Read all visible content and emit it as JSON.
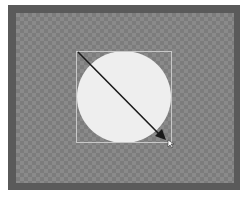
{
  "canvas": {
    "background": "transparent-checkerboard",
    "frame_color": "#5a5a5a",
    "checker_light": "#8a8a8a",
    "checker_dark": "#7c7c7c"
  },
  "shape": {
    "type": "ellipse",
    "fill": "#eeeeee",
    "selected": true
  },
  "selection_box": {
    "stroke": "#c8c8c8"
  },
  "drag_arrow": {
    "color": "#1a1a1a",
    "direction": "top-left to bottom-right"
  },
  "cursor": {
    "icon": "resize-cursor-icon"
  }
}
